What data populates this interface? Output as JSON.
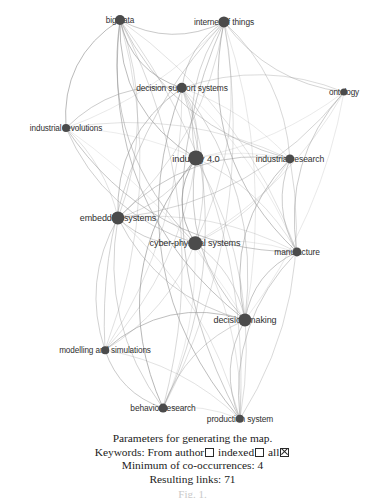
{
  "figure": {
    "caption_lines": [
      "Parameters for generating the map.",
      "Minimum of co-occurrences: 4",
      "Resulting links: 71"
    ],
    "keywords_label": "Keywords:",
    "keywords_opt_author": "From author",
    "keywords_opt_indexed": "indexed",
    "keywords_opt_all": "all",
    "tail_text": "Fig. 1."
  },
  "chart_data": {
    "type": "scatter",
    "title": "",
    "subtitle": "",
    "xlabel": "",
    "ylabel": "",
    "layout": "network graph (co-occurrence map)",
    "node_color": "#4b4b4b",
    "edge_color": "#9a9a9a",
    "background": "#ffffff",
    "xlim": [
      0,
      385
    ],
    "ylim": [
      0,
      432
    ],
    "grid": false,
    "legend": "none",
    "link_count": 71,
    "min_cooccurrences": 4,
    "nodes": [
      {
        "id": "big-data",
        "label": "big data",
        "x": 120,
        "y": 20,
        "r": 5.0,
        "label_dx": 0,
        "label_dy": 0,
        "font": 8.2
      },
      {
        "id": "internet-of-things",
        "label": "internet of things",
        "x": 224,
        "y": 22,
        "r": 5.6,
        "label_dx": 0,
        "label_dy": 0,
        "font": 8.4
      },
      {
        "id": "decision-support-systems",
        "label": "decision support systems",
        "x": 182,
        "y": 88,
        "r": 5.2,
        "label_dx": 0,
        "label_dy": 0,
        "font": 8.4
      },
      {
        "id": "ontology",
        "label": "ontology",
        "x": 344,
        "y": 92,
        "r": 3.6,
        "label_dx": 0,
        "label_dy": 0,
        "font": 8.2
      },
      {
        "id": "industrial-revolutions",
        "label": "industrial revolutions",
        "x": 66,
        "y": 128,
        "r": 4.0,
        "label_dx": 0,
        "label_dy": 0,
        "font": 8.2
      },
      {
        "id": "industry-40",
        "label": "industry 4.0",
        "x": 196,
        "y": 158,
        "r": 7.6,
        "label_dx": 0,
        "label_dy": 0,
        "font": 9.4
      },
      {
        "id": "industrial-research",
        "label": "industrial research",
        "x": 290,
        "y": 159,
        "r": 4.6,
        "label_dx": 0,
        "label_dy": 0,
        "font": 8.6
      },
      {
        "id": "embedded-systems",
        "label": "embedded systems",
        "x": 118,
        "y": 218,
        "r": 6.6,
        "label_dx": 0,
        "label_dy": 0,
        "font": 9.0
      },
      {
        "id": "cyber-physical-systems",
        "label": "cyber-physical systems",
        "x": 195,
        "y": 243,
        "r": 6.8,
        "label_dx": 0,
        "label_dy": 0,
        "font": 9.0
      },
      {
        "id": "manufacture",
        "label": "manufacture",
        "x": 297,
        "y": 252,
        "r": 4.6,
        "label_dx": 0,
        "label_dy": 0,
        "font": 8.4
      },
      {
        "id": "decision-making",
        "label": "decision making",
        "x": 245,
        "y": 320,
        "r": 6.6,
        "label_dx": 0,
        "label_dy": 0,
        "font": 9.0
      },
      {
        "id": "modelling-and-simulations",
        "label": "modelling and simulations",
        "x": 105,
        "y": 350,
        "r": 3.8,
        "label_dx": 0,
        "label_dy": 0,
        "font": 8.2
      },
      {
        "id": "behavior-research",
        "label": "behavior research",
        "x": 163,
        "y": 408,
        "r": 4.4,
        "label_dx": 0,
        "label_dy": 0,
        "font": 8.4
      },
      {
        "id": "production-system",
        "label": "production system",
        "x": 240,
        "y": 419,
        "r": 4.2,
        "label_dx": 0,
        "label_dy": 0,
        "font": 8.4
      }
    ],
    "edges": [
      [
        "big-data",
        "internet-of-things"
      ],
      [
        "big-data",
        "decision-support-systems"
      ],
      [
        "big-data",
        "industry-40"
      ],
      [
        "big-data",
        "industrial-revolutions"
      ],
      [
        "big-data",
        "embedded-systems"
      ],
      [
        "big-data",
        "cyber-physical-systems"
      ],
      [
        "big-data",
        "decision-making"
      ],
      [
        "big-data",
        "manufacture"
      ],
      [
        "big-data",
        "industrial-research"
      ],
      [
        "big-data",
        "behavior-research"
      ],
      [
        "big-data",
        "production-system"
      ],
      [
        "big-data",
        "modelling-and-simulations"
      ],
      [
        "internet-of-things",
        "decision-support-systems"
      ],
      [
        "internet-of-things",
        "ontology"
      ],
      [
        "internet-of-things",
        "industry-40"
      ],
      [
        "internet-of-things",
        "industrial-research"
      ],
      [
        "internet-of-things",
        "embedded-systems"
      ],
      [
        "internet-of-things",
        "cyber-physical-systems"
      ],
      [
        "internet-of-things",
        "manufacture"
      ],
      [
        "internet-of-things",
        "decision-making"
      ],
      [
        "internet-of-things",
        "industrial-revolutions"
      ],
      [
        "internet-of-things",
        "behavior-research"
      ],
      [
        "internet-of-things",
        "production-system"
      ],
      [
        "internet-of-things",
        "modelling-and-simulations"
      ],
      [
        "decision-support-systems",
        "industry-40"
      ],
      [
        "decision-support-systems",
        "industrial-revolutions"
      ],
      [
        "decision-support-systems",
        "embedded-systems"
      ],
      [
        "decision-support-systems",
        "cyber-physical-systems"
      ],
      [
        "decision-support-systems",
        "decision-making"
      ],
      [
        "decision-support-systems",
        "manufacture"
      ],
      [
        "decision-support-systems",
        "industrial-research"
      ],
      [
        "decision-support-systems",
        "ontology"
      ],
      [
        "decision-support-systems",
        "behavior-research"
      ],
      [
        "decision-support-systems",
        "production-system"
      ],
      [
        "decision-support-systems",
        "modelling-and-simulations"
      ],
      [
        "ontology",
        "industry-40"
      ],
      [
        "ontology",
        "cyber-physical-systems"
      ],
      [
        "ontology",
        "decision-making"
      ],
      [
        "ontology",
        "manufacture"
      ],
      [
        "ontology",
        "embedded-systems"
      ],
      [
        "industrial-revolutions",
        "industry-40"
      ],
      [
        "industrial-revolutions",
        "embedded-systems"
      ],
      [
        "industrial-revolutions",
        "cyber-physical-systems"
      ],
      [
        "industrial-revolutions",
        "decision-making"
      ],
      [
        "industrial-revolutions",
        "manufacture"
      ],
      [
        "industrial-revolutions",
        "industrial-research"
      ],
      [
        "industry-40",
        "industrial-research"
      ],
      [
        "industry-40",
        "embedded-systems"
      ],
      [
        "industry-40",
        "cyber-physical-systems"
      ],
      [
        "industry-40",
        "manufacture"
      ],
      [
        "industry-40",
        "decision-making"
      ],
      [
        "industry-40",
        "modelling-and-simulations"
      ],
      [
        "industry-40",
        "behavior-research"
      ],
      [
        "industry-40",
        "production-system"
      ],
      [
        "industrial-research",
        "embedded-systems"
      ],
      [
        "industrial-research",
        "cyber-physical-systems"
      ],
      [
        "industrial-research",
        "manufacture"
      ],
      [
        "industrial-research",
        "decision-making"
      ],
      [
        "industrial-research",
        "production-system"
      ],
      [
        "embedded-systems",
        "cyber-physical-systems"
      ],
      [
        "embedded-systems",
        "manufacture"
      ],
      [
        "embedded-systems",
        "decision-making"
      ],
      [
        "embedded-systems",
        "modelling-and-simulations"
      ],
      [
        "embedded-systems",
        "behavior-research"
      ],
      [
        "embedded-systems",
        "production-system"
      ],
      [
        "cyber-physical-systems",
        "manufacture"
      ],
      [
        "cyber-physical-systems",
        "decision-making"
      ],
      [
        "cyber-physical-systems",
        "modelling-and-simulations"
      ],
      [
        "cyber-physical-systems",
        "behavior-research"
      ],
      [
        "cyber-physical-systems",
        "production-system"
      ],
      [
        "manufacture",
        "decision-making"
      ],
      [
        "manufacture",
        "production-system"
      ],
      [
        "decision-making",
        "modelling-and-simulations"
      ],
      [
        "decision-making",
        "behavior-research"
      ],
      [
        "decision-making",
        "production-system"
      ],
      [
        "modelling-and-simulations",
        "behavior-research"
      ],
      [
        "modelling-and-simulations",
        "production-system"
      ],
      [
        "behavior-research",
        "production-system"
      ]
    ]
  }
}
